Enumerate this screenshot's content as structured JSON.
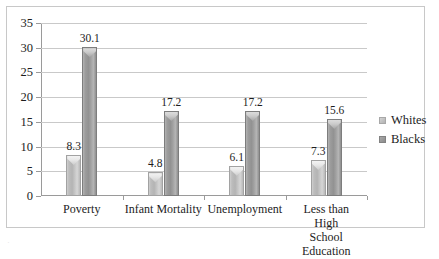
{
  "chart_data": {
    "type": "bar",
    "title": "",
    "xlabel": "",
    "ylabel": "",
    "ylim": [
      0,
      35
    ],
    "ytick_step": 5,
    "grid": true,
    "legend_position": "right",
    "categories": [
      "Poverty",
      "Infant Mortality",
      "Unemployment",
      "Less than High\nSchool Education"
    ],
    "ytick_labels": [
      "0",
      "5",
      "10",
      "15",
      "20",
      "25",
      "30",
      "35"
    ],
    "series": [
      {
        "name": "Whites",
        "color": "#bdbdbd",
        "values": [
          8.3,
          4.8,
          6.1,
          7.3
        ],
        "labels": [
          "8.3",
          "4.8",
          "6.1",
          "7.3"
        ]
      },
      {
        "name": "Blacks",
        "color": "#9a9a9a",
        "values": [
          30.1,
          17.2,
          17.2,
          15.6
        ],
        "labels": [
          "30.1",
          "17.2",
          "17.2",
          "15.6"
        ]
      }
    ]
  },
  "legend": {
    "items": [
      {
        "label": "Whites",
        "swatch": "whites"
      },
      {
        "label": "Blacks",
        "swatch": "blacks"
      }
    ]
  },
  "caption": {
    "clipped_text": "."
  }
}
